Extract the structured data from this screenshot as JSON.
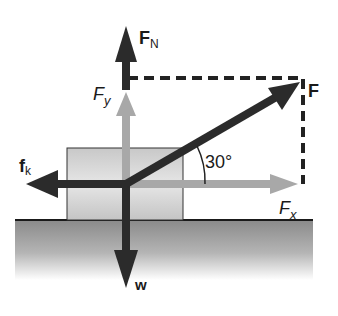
{
  "diagram": {
    "type": "free-body-diagram",
    "labels": {
      "normal_force": "F",
      "normal_force_sub": "N",
      "applied_force": "F",
      "fy": "F",
      "fy_sub": "y",
      "fx": "F",
      "fx_sub": "x",
      "friction": "f",
      "friction_sub": "k",
      "weight": "w",
      "angle": "30°"
    },
    "colors": {
      "dark_arrow": "#2b2b2b",
      "component_arrow": "#a8a8a8",
      "block_fill": "#d4d4d4",
      "ground_top": "#8a8a8a",
      "ground_bottom": "#ffffff",
      "text": "#1a1a1a"
    }
  }
}
